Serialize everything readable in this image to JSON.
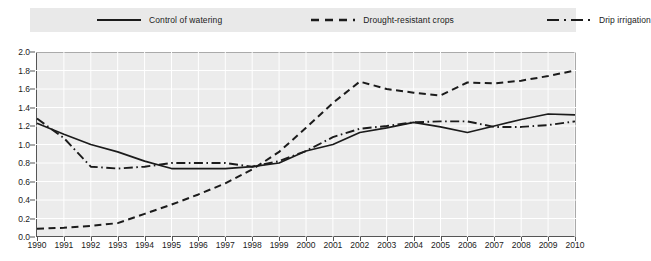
{
  "chart_data": {
    "type": "line",
    "title": "",
    "subtitle": "",
    "xlabel": "",
    "ylabel": "",
    "xlim": [
      1990,
      2010
    ],
    "ylim": [
      0.0,
      2.0
    ],
    "grid": true,
    "legend_position": "top",
    "x": [
      1990,
      1991,
      1992,
      1993,
      1994,
      1995,
      1996,
      1997,
      1998,
      1999,
      2000,
      2001,
      2002,
      2003,
      2004,
      2005,
      2006,
      2007,
      2008,
      2009,
      2010
    ],
    "categories": [
      "1990",
      "1991",
      "1992",
      "1993",
      "1994",
      "1995",
      "1996",
      "1997",
      "1998",
      "1999",
      "2000",
      "2001",
      "2002",
      "2003",
      "2004",
      "2005",
      "2006",
      "2007",
      "2008",
      "2009",
      "2010"
    ],
    "yticks": [
      "0.0",
      "0.2",
      "0.4",
      "0.6",
      "0.8",
      "1.0",
      "1.2",
      "1.4",
      "1.6",
      "1.8",
      "2.0"
    ],
    "ytick_values": [
      0.0,
      0.2,
      0.4,
      0.6,
      0.8,
      1.0,
      1.2,
      1.4,
      1.6,
      1.8,
      2.0
    ],
    "series": [
      {
        "name": "Control of watering",
        "style": "solid",
        "color": "#1b1b1b",
        "values": [
          1.23,
          1.11,
          1.0,
          0.92,
          0.82,
          0.74,
          0.74,
          0.74,
          0.76,
          0.8,
          0.93,
          1.0,
          1.13,
          1.18,
          1.24,
          1.19,
          1.13,
          1.2,
          1.27,
          1.33,
          1.32
        ]
      },
      {
        "name": "Drought-resistant crops",
        "style": "dashed",
        "color": "#1b1b1b",
        "values": [
          0.09,
          0.1,
          0.12,
          0.15,
          0.25,
          0.35,
          0.46,
          0.58,
          0.73,
          0.92,
          1.18,
          1.45,
          1.68,
          1.6,
          1.56,
          1.53,
          1.67,
          1.66,
          1.69,
          1.74,
          1.8
        ]
      },
      {
        "name": "Drip irrigation",
        "style": "dashdot",
        "color": "#1b1b1b",
        "values": [
          1.28,
          1.07,
          0.76,
          0.74,
          0.76,
          0.8,
          0.8,
          0.8,
          0.76,
          0.82,
          0.93,
          1.08,
          1.17,
          1.2,
          1.24,
          1.25,
          1.25,
          1.19,
          1.19,
          1.21,
          1.25
        ]
      }
    ]
  },
  "legend": {
    "items": [
      {
        "label": "Control of watering",
        "style": "solid"
      },
      {
        "label": "Drought-resistant crops",
        "style": "dashed"
      },
      {
        "label": "Drip irrigation",
        "style": "dashdot"
      }
    ]
  },
  "colors": {
    "plot_background": "#ececec",
    "legend_background": "#e9e9e9",
    "axis": "#555555",
    "gridline": "#ffffff",
    "line": "#1b1b1b",
    "text": "#1b1b1b"
  }
}
